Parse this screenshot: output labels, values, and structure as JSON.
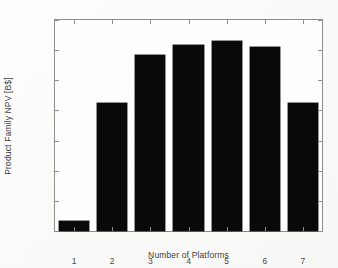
{
  "chart_data": {
    "type": "bar",
    "title": "",
    "xlabel": "Number of Platforms",
    "ylabel": "Product Family NPV [B$]",
    "categories": [
      "1",
      "2",
      "3",
      "4",
      "5",
      "6",
      "7"
    ],
    "values": [
      1016,
      1212,
      1292,
      1309,
      1315,
      1306,
      1213
    ],
    "ylim": [
      1000,
      1350
    ],
    "ytick_labels": [
      "1000",
      "1050",
      "1100",
      "1150",
      "1200",
      "1250",
      "1300",
      "1350"
    ],
    "ytick_values": [
      1000,
      1050,
      1100,
      1150,
      1200,
      1250,
      1300,
      1350
    ],
    "ystep": 50,
    "xtick_labels": [
      "1",
      "2",
      "3",
      "4",
      "5",
      "6",
      "7"
    ],
    "grid": false,
    "legend": null,
    "legend_position": "none",
    "bar_color": "#090909",
    "axis_color": "#8e8e8e",
    "text_color": "#3f3f3f",
    "background_color": "#fdfdfd",
    "bars": [
      {
        "category": "1",
        "value": 1016,
        "label": "1"
      },
      {
        "category": "2",
        "value": 1212,
        "label": "2"
      },
      {
        "category": "3",
        "value": 1292,
        "label": "3"
      },
      {
        "category": "4",
        "value": 1309,
        "label": "4"
      },
      {
        "category": "5",
        "value": 1315,
        "label": "5"
      },
      {
        "category": "6",
        "value": 1306,
        "label": "6"
      },
      {
        "category": "7",
        "value": 1213,
        "label": "7"
      }
    ]
  }
}
